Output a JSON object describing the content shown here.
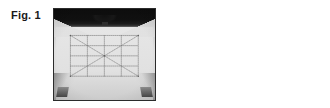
{
  "page": {
    "kind": "patent-figure-sheet",
    "background_color": "#ffffff",
    "width": 330,
    "height": 108
  },
  "figures": [
    {
      "id": "fig1",
      "caption": "Fig. 1",
      "photo": {
        "alt": "Photograph of a white T-shirt laid flat against a dark background, printed or marked with a dotted rectangular grid containing crossing diagonal lines and a centre cross.",
        "subject": "white t-shirt with dotted grid layout marking",
        "background_color": "#101010",
        "garment_color": "#e2e2e2",
        "marking_color": "#6f6f6f",
        "frame_border_color": "#2b2b2b",
        "elements": [
          "dark backdrop band",
          "shirt collar and shoulders",
          "dotted rectangle outline",
          "dotted diagonal lines forming an X",
          "dotted vertical centre line",
          "dotted horizontal centre line",
          "corner registration dots",
          "clips holding shirt hem"
        ]
      }
    },
    {
      "id": "fig2",
      "caption": "Fig. 2",
      "photo": {
        "alt": "Photograph of light grey fabric printed with three black joined paper-doll figures holding hands, surrounded by faint horizontal streaks.",
        "subject": "three joined paper-doll figures printed on fabric",
        "background_color": "#c8c8c8",
        "figure_color": "#141414",
        "frame_border_color": "#3a3a3a",
        "doll_count": 3,
        "elements": [
          "woven fabric texture",
          "horizontal ink streaks",
          "three black doll silhouettes holding hands",
          "joined arms forming a chain"
        ]
      }
    }
  ]
}
